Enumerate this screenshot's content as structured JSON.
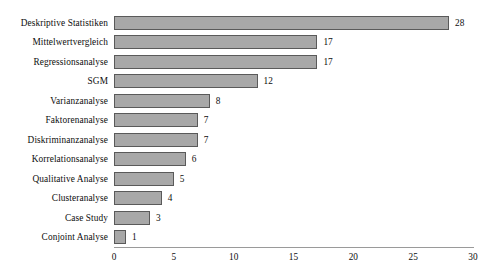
{
  "chart_data": {
    "type": "bar",
    "orientation": "horizontal",
    "title": "",
    "xlabel": "",
    "ylabel": "",
    "xlim": [
      0,
      30
    ],
    "grid": false,
    "legend": false,
    "categories": [
      "Deskriptive Statistiken",
      "Mittelwertvergleich",
      "Regressionsanalyse",
      "SGM",
      "Varianzanalyse",
      "Faktorenanalyse",
      "Diskriminanzanalyse",
      "Korrelationsanalyse",
      "Qualitative Analyse",
      "Clusteranalyse",
      "Case Study",
      "Conjoint Analyse"
    ],
    "values": [
      28,
      17,
      17,
      12,
      8,
      7,
      7,
      6,
      5,
      4,
      3,
      1
    ],
    "value_labels": [
      "28",
      "17",
      "17",
      "12",
      "8",
      "7",
      "7",
      "6",
      "5",
      "4",
      "3",
      "1"
    ],
    "xticks": [
      0,
      5,
      10,
      15,
      20,
      25,
      30
    ],
    "xtick_labels": [
      "0",
      "5",
      "10",
      "15",
      "20",
      "25",
      "30"
    ],
    "colors": {
      "bar_fill": "#a8a8a8",
      "bar_border": "#5a5a5a",
      "axis": "#9a9a9a",
      "text": "#0d0d0d",
      "background": "#ffffff"
    }
  }
}
